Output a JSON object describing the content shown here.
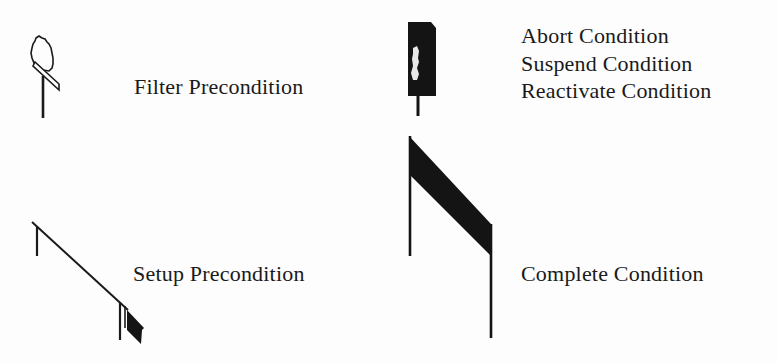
{
  "legend": {
    "items": [
      {
        "icon": "filter-precondition-icon",
        "labels": [
          "Filter Precondition"
        ]
      },
      {
        "icon": "abort-suspend-reactivate-condition-icon",
        "labels": [
          "Abort Condition",
          "Suspend Condition",
          "Reactivate Condition"
        ]
      },
      {
        "icon": "setup-precondition-icon",
        "labels": [
          "Setup Precondition"
        ]
      },
      {
        "icon": "complete-condition-icon",
        "labels": [
          "Complete Condition"
        ]
      }
    ]
  },
  "colors": {
    "ink": "#1a1a1a",
    "paper": "#fdfdfd"
  }
}
